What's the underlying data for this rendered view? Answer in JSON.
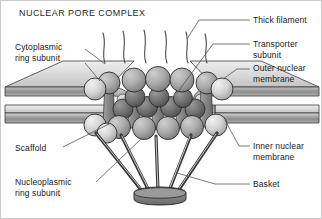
{
  "figure": {
    "title": "NUCLEAR PORE COMPLEX",
    "background_color": "#ffffff",
    "border_color": "#c9c9c9",
    "text_color": "#1a1a1a",
    "leader_line_color": "#555555"
  },
  "labels": {
    "cytoplasmic_ring_subunit": "Cytoplasmic\nring subunit",
    "scaffold": "Scaffold",
    "nucleoplasmic_ring_subunit": "Nucleoplasmic\nring subunit",
    "thick_filament": "Thick filament",
    "transporter_subunit": "Transporter\nsubunit",
    "outer_nuclear_membrane": "Outer nuclear\nmembrane",
    "inner_nuclear_membrane": "Inner nuclear\nmembrane",
    "basket": "Basket"
  },
  "diagram": {
    "palette": {
      "membrane_top_face": "#d8d8d8",
      "membrane_edge": "#9a9a9a",
      "membrane_shadow": "#7e7e7e",
      "ring_subunit_light": "#d2d2d2",
      "ring_subunit_mid": "#a8a8a8",
      "transporter_dark": "#6e6e6e",
      "scaffold_column": "#8f8f8f",
      "basket_body": "#7a7a7a",
      "filament_stroke": "#4a4a4a",
      "outline": "#2b2b2b"
    },
    "components": {
      "thick_filaments_count": 6,
      "cytoplasmic_ring_subunits_count": 7,
      "transporter_subunits_count": 5,
      "nucleoplasmic_ring_subunits_count": 7,
      "basket_filaments_count": 5
    }
  }
}
